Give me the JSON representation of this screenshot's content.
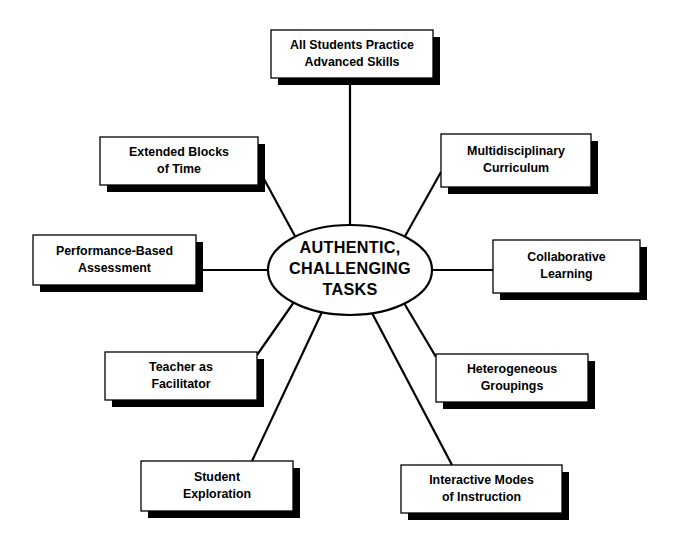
{
  "diagram": {
    "type": "hub-and-spoke",
    "center": {
      "name": "center-node",
      "lines": [
        "AUTHENTIC,",
        "CHALLENGING",
        "TASKS"
      ],
      "shape": "ellipse",
      "cx": 350,
      "cy": 270,
      "rx": 82,
      "ry": 45
    },
    "style": {
      "box_fill": "#ffffff",
      "box_stroke": "#000000",
      "shadow_color": "#000000",
      "line_color": "#000000",
      "background": "#ffffff",
      "shadow_offset_x": 7,
      "shadow_offset_y": 7
    },
    "nodes": [
      {
        "id": "all-students-practice-advanced-skills",
        "lines": [
          "All Students Practice",
          "Advanced Skills"
        ],
        "x": 271,
        "y": 30,
        "w": 162,
        "h": 48,
        "link": {
          "x1": 350,
          "y1": 78,
          "x2": 350,
          "y2": 225
        }
      },
      {
        "id": "multidisciplinary-curriculum",
        "lines": [
          "Multidisciplinary",
          "Curriculum"
        ],
        "x": 441,
        "y": 134,
        "w": 150,
        "h": 53,
        "link": {
          "x1": 441,
          "y1": 172,
          "x2": 404,
          "y2": 238
        }
      },
      {
        "id": "collaborative-learning",
        "lines": [
          "Collaborative",
          "Learning"
        ],
        "x": 493,
        "y": 240,
        "w": 147,
        "h": 53,
        "link": {
          "x1": 493,
          "y1": 270,
          "x2": 432,
          "y2": 270
        }
      },
      {
        "id": "heterogeneous-groupings",
        "lines": [
          "Heterogeneous",
          "Groupings"
        ],
        "x": 436,
        "y": 354,
        "w": 152,
        "h": 48,
        "link": {
          "x1": 436,
          "y1": 357,
          "x2": 404,
          "y2": 303
        }
      },
      {
        "id": "interactive-modes-of-instruction",
        "lines": [
          "Interactive Modes",
          "of Instruction"
        ],
        "x": 401,
        "y": 465,
        "w": 161,
        "h": 48,
        "link": {
          "x1": 452,
          "y1": 465,
          "x2": 372,
          "y2": 313
        }
      },
      {
        "id": "student-exploration",
        "lines": [
          "Student",
          "Exploration"
        ],
        "x": 141,
        "y": 461,
        "w": 152,
        "h": 50,
        "link": {
          "x1": 252,
          "y1": 461,
          "x2": 322,
          "y2": 312
        }
      },
      {
        "id": "teacher-as-facilitator",
        "lines": [
          "Teacher as",
          "Facilitator"
        ],
        "x": 105,
        "y": 352,
        "w": 152,
        "h": 48,
        "link": {
          "x1": 257,
          "y1": 355,
          "x2": 294,
          "y2": 302
        }
      },
      {
        "id": "performance-based-assessment",
        "lines": [
          "Performance-Based",
          "Assessment"
        ],
        "x": 33,
        "y": 235,
        "w": 163,
        "h": 50,
        "link": {
          "x1": 196,
          "y1": 270,
          "x2": 268,
          "y2": 270
        }
      },
      {
        "id": "extended-blocks-of-time",
        "lines": [
          "Extended Blocks",
          "of Time"
        ],
        "x": 100,
        "y": 137,
        "w": 158,
        "h": 48,
        "link": {
          "x1": 258,
          "y1": 168,
          "x2": 296,
          "y2": 238
        }
      }
    ]
  }
}
